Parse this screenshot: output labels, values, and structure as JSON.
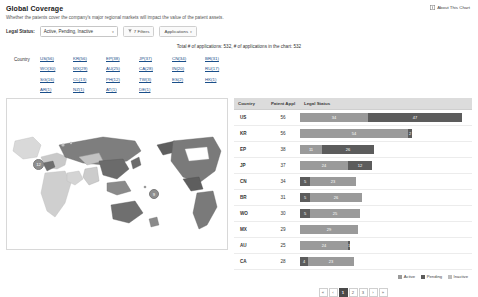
{
  "header": {
    "title": "Global Coverage",
    "subtitle": "Whether the patents cover the company's major regional markets will impact the value of the patent assets.",
    "about_label": "About This Chart",
    "about_icon": "info-icon"
  },
  "filters": {
    "legal_status_label": "Legal Status:",
    "legal_status_value": "Active, Pending, Inactive",
    "filters_button": "7 Filters",
    "filters_icon": "funnel-icon",
    "applications_button": "Applications",
    "caret_icon": "chevron-down-icon"
  },
  "totals": {
    "text": "Total # of applications:  532, # of applications in the chart:  532"
  },
  "country_links": {
    "label": "Country",
    "items": [
      "US(56)",
      "KR(56)",
      "EP(38)",
      "JP(37)",
      "CN(34)",
      "BR(31)",
      "WO(30)",
      "MX(29)",
      "AU(25)",
      "CA(28)",
      "IN(20)",
      "RU(17)",
      "SG(16)",
      "CL(13)",
      "PH(12)",
      "TW(3)",
      "ES(2)",
      "HK(1)",
      "AR(1)",
      "NZ(1)",
      "AT(1)",
      "DE(1)"
    ]
  },
  "map": {
    "clusters": [
      {
        "label": "12",
        "size": 11,
        "x": 32,
        "y": 66
      },
      {
        "label": "9",
        "size": 9,
        "x": 148,
        "y": 96
      }
    ]
  },
  "table": {
    "columns": [
      "Country",
      "Patent Appl",
      "Legal Status"
    ],
    "rows": [
      {
        "country": "US",
        "count": 56,
        "segments": [
          {
            "status": "active",
            "value": 34
          },
          {
            "status": "pending",
            "value": 47
          }
        ]
      },
      {
        "country": "KR",
        "count": 56,
        "segments": [
          {
            "status": "active",
            "value": 54
          },
          {
            "status": "pending",
            "value": 2
          }
        ]
      },
      {
        "country": "EP",
        "count": 38,
        "segments": [
          {
            "status": "active",
            "value": 11
          },
          {
            "status": "pending",
            "value": 26
          }
        ]
      },
      {
        "country": "JP",
        "count": 37,
        "segments": [
          {
            "status": "active",
            "value": 24
          },
          {
            "status": "pending",
            "value": 12
          }
        ]
      },
      {
        "country": "CN",
        "count": 34,
        "segments": [
          {
            "status": "pending",
            "value": 5
          },
          {
            "status": "active",
            "value": 23
          }
        ]
      },
      {
        "country": "BR",
        "count": 31,
        "segments": [
          {
            "status": "pending",
            "value": 5
          },
          {
            "status": "active",
            "value": 26
          }
        ]
      },
      {
        "country": "WO",
        "count": 30,
        "segments": [
          {
            "status": "pending",
            "value": 5
          },
          {
            "status": "active",
            "value": 25
          }
        ]
      },
      {
        "country": "MX",
        "count": 29,
        "segments": [
          {
            "status": "active",
            "value": 29
          }
        ]
      },
      {
        "country": "AU",
        "count": 25,
        "segments": [
          {
            "status": "active",
            "value": 24
          },
          {
            "status": "pending",
            "value": 1
          }
        ]
      },
      {
        "country": "CA",
        "count": 28,
        "segments": [
          {
            "status": "pending",
            "value": 4
          },
          {
            "status": "active",
            "value": 23
          }
        ]
      }
    ]
  },
  "legend": {
    "items": [
      {
        "label": "Active",
        "status": "active",
        "color": "#9a9a9a"
      },
      {
        "label": "Pending",
        "status": "pending",
        "color": "#5c5c5c"
      },
      {
        "label": "Inactive",
        "status": "inactive",
        "color": "#bdbdbd"
      }
    ]
  },
  "pagination": {
    "items": [
      {
        "label": "«",
        "active": false
      },
      {
        "label": "‹",
        "active": false
      },
      {
        "label": "1",
        "active": true
      },
      {
        "label": "2",
        "active": false
      },
      {
        "label": "3",
        "active": false
      },
      {
        "label": "›",
        "active": false
      },
      {
        "label": "»",
        "active": false
      }
    ]
  },
  "chart_data": {
    "type": "bar",
    "title": "Global Coverage",
    "orientation": "horizontal",
    "stacked": true,
    "categories": [
      "US",
      "KR",
      "EP",
      "JP",
      "CN",
      "BR",
      "WO",
      "MX",
      "AU",
      "CA"
    ],
    "totals": [
      56,
      56,
      38,
      37,
      34,
      31,
      30,
      29,
      25,
      28
    ],
    "series": [
      {
        "name": "Active",
        "values": [
          34,
          54,
          11,
          24,
          23,
          26,
          25,
          29,
          24,
          23
        ]
      },
      {
        "name": "Pending",
        "values": [
          47,
          2,
          26,
          12,
          5,
          5,
          5,
          0,
          1,
          4
        ]
      },
      {
        "name": "Inactive",
        "values": [
          0,
          0,
          0,
          0,
          0,
          0,
          0,
          0,
          0,
          0
        ]
      }
    ],
    "xlabel": "Legal Status",
    "ylabel": "Country",
    "legend_position": "bottom-right",
    "grid": false
  }
}
